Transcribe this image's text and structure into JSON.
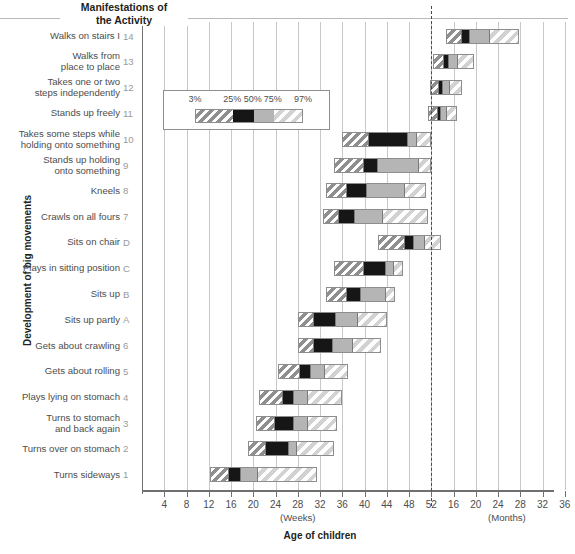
{
  "header": {
    "title": "Manifestations of\nthe Activity",
    "title_line1": "Manifestations of",
    "title_line2": "the Activity"
  },
  "axes": {
    "y_title": "Development of big movements",
    "x_title": "Age of children",
    "x_unit_left": "(Weeks)",
    "x_unit_right": "(Months)",
    "weeks_ticks": [
      4,
      8,
      12,
      16,
      20,
      24,
      28,
      32,
      36,
      40,
      44,
      48,
      52
    ],
    "months_ticks": [
      16,
      20,
      24,
      28,
      32,
      36
    ],
    "divider_label": "52"
  },
  "legend": {
    "title": "",
    "percentiles": [
      "3%",
      "25%",
      "50%",
      "75%",
      "97%"
    ],
    "segments": [
      {
        "name": "p3-p25",
        "pattern": "diagonal-hatch-dark",
        "color": "#8f8f8f"
      },
      {
        "name": "p25-p50",
        "pattern": "solid",
        "color": "#161616"
      },
      {
        "name": "p50-p75",
        "pattern": "solid",
        "color": "#b5b5b5"
      },
      {
        "name": "p75-p97",
        "pattern": "diagonal-hatch-light",
        "color": "#d2d2d2"
      }
    ]
  },
  "chart_data": {
    "type": "bar",
    "title": "Development of big movements",
    "subtitle": "Manifestations of the Activity",
    "xlabel": "Age of children",
    "ylabel": "Development of big movements",
    "x_unit_left": "(Weeks)",
    "x_unit_right": "(Months)",
    "xlim_weeks": [
      0,
      52
    ],
    "xlim_months": [
      12,
      36
    ],
    "grid": true,
    "legend_position": "inside-upper-left",
    "percentile_levels": [
      3,
      25,
      50,
      75,
      97
    ],
    "note": "Each bar spans the 3rd to 97th percentile of age at which the milestone is achieved; x values before the dashed line are weeks, after are months.",
    "categories": [
      "Walks on stairs I",
      "Walks from place to place",
      "Takes one or two steps independently",
      "Stands up freely",
      "Takes some steps while holding onto something",
      "Stands up holding onto something",
      "Kneels",
      "Crawls on all fours",
      "Sits on chair",
      "Plays in sitting position",
      "Sits up",
      "Sits up partly",
      "Gets about crawling",
      "Gets about rolling",
      "Plays lying on stomach",
      "Turns to stomach and back again",
      "Turns over on stomach",
      "Turns sideways"
    ],
    "rows": [
      {
        "id": "14",
        "label": "Walks on stairs I",
        "label_lines": [
          "Walks on stairs I"
        ],
        "unit": "months",
        "p3": 14.6,
        "p25": 17.2,
        "p50": 18.6,
        "p75": 22.2,
        "p97": 27.8
      },
      {
        "id": "13",
        "label": "Walks from place to place",
        "label_lines": [
          "Walks from",
          "place to place"
        ],
        "unit": "months",
        "p3": 12.3,
        "p25": 13.9,
        "p50": 14.8,
        "p75": 16.4,
        "p97": 19.6
      },
      {
        "id": "12",
        "label": "Takes one or two steps independently",
        "label_lines": [
          "Takes one or two",
          "steps independently"
        ],
        "unit": "months",
        "p3": 11.8,
        "p25": 13.0,
        "p50": 13.7,
        "p75": 15.0,
        "p97": 17.6
      },
      {
        "id": "11",
        "label": "Stands up freely",
        "label_lines": [
          "Stands up freely"
        ],
        "unit": "months",
        "p3": 11.4,
        "p25": 12.8,
        "p50": 13.4,
        "p75": 14.4,
        "p97": 16.6
      },
      {
        "id": "10",
        "label": "Takes some steps while holding onto something",
        "label_lines": [
          "Takes some steps while",
          "holding onto something"
        ],
        "unit": "weeks",
        "p3": 36.0,
        "p25": 40.5,
        "p50": 47.5,
        "p75": 49.0,
        "p97": 52.0
      },
      {
        "id": "9",
        "label": "Stands up holding onto something",
        "label_lines": [
          "Stands up holding",
          "onto something"
        ],
        "unit": "weeks",
        "p3": 34.5,
        "p25": 39.5,
        "p50": 42.0,
        "p75": 49.5,
        "p97": 52.0
      },
      {
        "id": "8",
        "label": "Kneels",
        "label_lines": [
          "Kneels"
        ],
        "unit": "weeks",
        "p3": 33.0,
        "p25": 36.5,
        "p50": 40.0,
        "p75": 47.0,
        "p97": 51.0
      },
      {
        "id": "7",
        "label": "Crawls on all fours",
        "label_lines": [
          "Crawls on all fours"
        ],
        "unit": "weeks",
        "p3": 32.5,
        "p25": 35.0,
        "p50": 38.0,
        "p75": 43.0,
        "p97": 51.5
      },
      {
        "id": "D",
        "label": "Sits on chair",
        "label_lines": [
          "Sits on chair"
        ],
        "unit": "weeks",
        "p3": 42.5,
        "p25": 47.0,
        "p50": 48.5,
        "p75": 50.5,
        "p97": 53.8
      },
      {
        "id": "C",
        "label": "Plays in sitting position",
        "label_lines": [
          "Plays in sitting position"
        ],
        "unit": "weeks",
        "p3": 34.5,
        "p25": 39.5,
        "p50": 43.5,
        "p75": 45.0,
        "p97": 47.0
      },
      {
        "id": "B",
        "label": "Sits up",
        "label_lines": [
          "Sits up"
        ],
        "unit": "weeks",
        "p3": 33.0,
        "p25": 36.5,
        "p50": 39.0,
        "p75": 43.5,
        "p97": 45.5
      },
      {
        "id": "A",
        "label": "Sits up partly",
        "label_lines": [
          "Sits up partly"
        ],
        "unit": "weeks",
        "p3": 28.0,
        "p25": 30.5,
        "p50": 34.5,
        "p75": 38.5,
        "p97": 44.0
      },
      {
        "id": "6",
        "label": "Gets about crawling",
        "label_lines": [
          "Gets about crawling"
        ],
        "unit": "weeks",
        "p3": 28.0,
        "p25": 30.5,
        "p50": 34.0,
        "p75": 37.5,
        "p97": 43.0
      },
      {
        "id": "5",
        "label": "Gets about rolling",
        "label_lines": [
          "Gets about rolling"
        ],
        "unit": "weeks",
        "p3": 24.5,
        "p25": 28.0,
        "p50": 30.0,
        "p75": 32.5,
        "p97": 37.0
      },
      {
        "id": "4",
        "label": "Plays lying on stomach",
        "label_lines": [
          "Plays lying on stomach"
        ],
        "unit": "weeks",
        "p3": 21.0,
        "p25": 25.0,
        "p50": 27.0,
        "p75": 29.5,
        "p97": 36.0
      },
      {
        "id": "3",
        "label": "Turns to stomach and back again",
        "label_lines": [
          "Turns to stomach",
          "and back again"
        ],
        "unit": "weeks",
        "p3": 20.5,
        "p25": 23.5,
        "p50": 27.0,
        "p75": 29.5,
        "p97": 35.0
      },
      {
        "id": "2",
        "label": "Turns over on stomach",
        "label_lines": [
          "Turns over on stomach"
        ],
        "unit": "weeks",
        "p3": 19.0,
        "p25": 22.0,
        "p50": 26.0,
        "p75": 27.5,
        "p97": 34.5
      },
      {
        "id": "1",
        "label": "Turns sideways",
        "label_lines": [
          "Turns sideways"
        ],
        "unit": "weeks",
        "p3": 12.2,
        "p25": 15.2,
        "p50": 17.5,
        "p75": 20.5,
        "p97": 31.5
      }
    ]
  }
}
